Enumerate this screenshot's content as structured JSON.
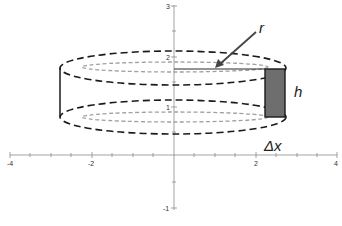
{
  "diagram": {
    "axes": {
      "x_ticks": [
        "-4",
        "-2",
        "2",
        "4"
      ],
      "y_ticks": [
        "3",
        "2",
        "1",
        "-1"
      ]
    },
    "labels": {
      "radius": "r",
      "height": "h",
      "thickness": "Δx"
    },
    "colors": {
      "outer_dash": "#1a1a1a",
      "inner_dash": "#9a9a9a",
      "shell_fill": "#6e6e6e",
      "axis": "#888888"
    }
  }
}
